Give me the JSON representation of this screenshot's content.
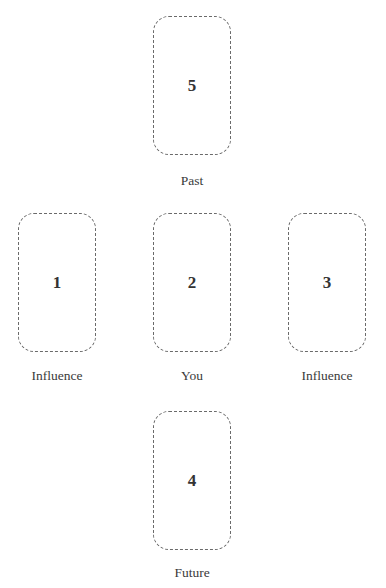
{
  "diagram": {
    "type": "tarot-spread-cross",
    "positions": [
      {
        "number": "5",
        "label": "Past"
      },
      {
        "number": "1",
        "label": "Influence"
      },
      {
        "number": "2",
        "label": "You"
      },
      {
        "number": "3",
        "label": "Influence"
      },
      {
        "number": "4",
        "label": "Future"
      }
    ]
  },
  "colors": {
    "border": "#6a6a6a",
    "text": "#333333",
    "background": "#ffffff"
  }
}
